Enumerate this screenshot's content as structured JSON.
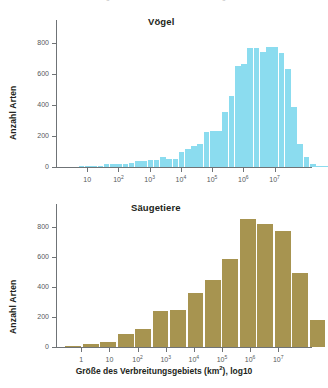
{
  "top_cutoff": {
    "fragment_left": "g",
    "fragment_right": "g"
  },
  "xaxis_caption": {
    "prefix": "Größe des Verbreitungsgebiets (km",
    "sup": "2",
    "suffix": "), log10",
    "full": "Größe des Verbreitungsgebiets (km²), log10"
  },
  "chart_data": [
    {
      "type": "bar",
      "title": "Vögel",
      "xlabel": "Größe des Verbreitungsgebiets (km²), log10",
      "ylabel": "Anzahl Arten",
      "ylim": [
        0,
        950
      ],
      "yticks": [
        0,
        200,
        400,
        600,
        800
      ],
      "ytick_labels": [
        "0",
        "200",
        "400",
        "600",
        "800"
      ],
      "grid": false,
      "legend": "none",
      "bar_color": "#8bdcef",
      "xlim_log10": [
        0.0,
        8.2
      ],
      "xticks_log10": [
        1,
        2,
        3,
        4,
        5,
        6,
        7
      ],
      "xtick_labels": [
        "10",
        "10²",
        "10³",
        "10⁴",
        "10⁵",
        "10⁶",
        "10⁷"
      ],
      "xtick_bases": [
        "10",
        "10",
        "10",
        "10",
        "10",
        "10",
        "10"
      ],
      "xtick_exponents": [
        "",
        "2",
        "3",
        "4",
        "5",
        "6",
        "7"
      ],
      "bin_width_log10": 0.2,
      "bin_start_log10": 0.1,
      "values": [
        0,
        0,
        0,
        2,
        3,
        4,
        6,
        22,
        19,
        17,
        20,
        28,
        38,
        40,
        44,
        47,
        66,
        52,
        50,
        100,
        118,
        134,
        150,
        228,
        232,
        230,
        355,
        460,
        652,
        668,
        770,
        768,
        742,
        776,
        774,
        734,
        634,
        388,
        148,
        62,
        20,
        8,
        4,
        2
      ],
      "peak_value": 905,
      "peak_index": 30
    },
    {
      "type": "bar",
      "title": "Säugetiere",
      "xlabel": "Größe des Verbreitungsgebiets (km²), log10",
      "ylabel": "Anzahl Arten",
      "ylim": [
        0,
        950
      ],
      "yticks": [
        0,
        200,
        400,
        600,
        800
      ],
      "ytick_labels": [
        "0",
        "200",
        "400",
        "600",
        "800"
      ],
      "grid": false,
      "legend": "none",
      "bar_color": "#a79450",
      "xlim_log10": [
        -0.9,
        8.2
      ],
      "xticks_log10": [
        0,
        1,
        2,
        3,
        4,
        5,
        6,
        7
      ],
      "xtick_labels": [
        "1",
        "10",
        "10²",
        "10³",
        "10⁴",
        "10⁵",
        "10⁶",
        "10⁷"
      ],
      "xtick_bases": [
        "1",
        "10",
        "10",
        "10",
        "10",
        "10",
        "10",
        "10"
      ],
      "xtick_exponents": [
        "",
        "",
        "2",
        "3",
        "4",
        "5",
        "6",
        "7"
      ],
      "bin_width_log10": 0.62,
      "bin_start_log10": -0.6,
      "values": [
        2,
        20,
        36,
        86,
        122,
        236,
        248,
        362,
        448,
        588,
        850,
        818,
        768,
        490,
        182
      ],
      "peak_value": 850,
      "peak_index": 10
    }
  ]
}
